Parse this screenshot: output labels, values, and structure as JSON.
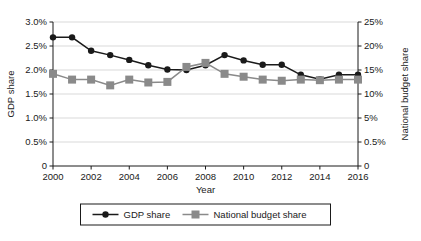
{
  "chart_data": {
    "type": "line",
    "title": "",
    "xlabel": "Year",
    "ylabel": "GDP share",
    "y2label": "National budget share",
    "grid": true,
    "legend_position": "bottom",
    "x": [
      2000,
      2001,
      2002,
      2003,
      2004,
      2005,
      2006,
      2007,
      2008,
      2009,
      2010,
      2011,
      2012,
      2013,
      2014,
      2015,
      2016
    ],
    "xtick_labels": [
      "2000",
      "2002",
      "2004",
      "2006",
      "2008",
      "2010",
      "2012",
      "2014",
      "2016"
    ],
    "xtick_values": [
      2000,
      2002,
      2004,
      2006,
      2008,
      2010,
      2012,
      2014,
      2016
    ],
    "xlim": [
      2000,
      2016
    ],
    "ytick_labels": [
      "0",
      "0.5%",
      "1.0%",
      "1.5%",
      "2.0%",
      "2.5%",
      "3.0%"
    ],
    "ytick_values": [
      0,
      0.5,
      1.0,
      1.5,
      2.0,
      2.5,
      3.0
    ],
    "ylim": [
      0,
      3.0
    ],
    "y2tick_labels": [
      "0",
      "0.5%",
      "5%",
      "10%",
      "15%",
      "20%",
      "25%"
    ],
    "y2tick_values": [
      0,
      0.5,
      5,
      10,
      15,
      20,
      25
    ],
    "y2lim": [
      0,
      25
    ],
    "series": [
      {
        "name": "GDP share",
        "axis": "left",
        "marker": "circle",
        "color": "#1a1a1a",
        "values": [
          2.68,
          2.68,
          2.4,
          2.31,
          2.21,
          2.1,
          2.01,
          2.0,
          2.1,
          2.31,
          2.2,
          2.11,
          2.11,
          1.9,
          1.81,
          1.9,
          1.9
        ]
      },
      {
        "name": "National budget share",
        "axis": "right",
        "marker": "square",
        "color": "#8a8a8a",
        "values": [
          16.0,
          15.0,
          15.0,
          14.0,
          15.0,
          14.5,
          14.6,
          17.2,
          17.9,
          16.0,
          15.5,
          15.0,
          14.8,
          15.0,
          14.9,
          15.0,
          15.0
        ]
      }
    ]
  },
  "legend": {
    "entries": [
      {
        "label": "GDP share",
        "marker": "circle",
        "color": "#1a1a1a"
      },
      {
        "label": "National budget share",
        "marker": "square",
        "color": "#8a8a8a"
      }
    ]
  },
  "colors": {
    "gdp": "#1a1a1a",
    "budget": "#8a8a8a",
    "grid": "#c8c8c8",
    "axis": "#1a1a1a",
    "background": "#ffffff"
  }
}
